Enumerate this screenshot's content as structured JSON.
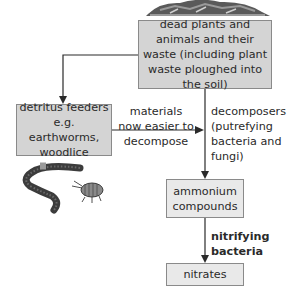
{
  "diagram": {
    "nodes": {
      "dead_matter": "dead plants and animals and their waste (including plant waste ploughed into the soil)",
      "detritus_feeders": "detritus feeders e.g. earthworms, woodlice",
      "ammonium": "ammonium compounds",
      "nitrates": "nitrates"
    },
    "edges": {
      "materials_label": "materials now easier to decompose",
      "decomposers_label": "decomposers (putrefying bacteria and fungi)",
      "nitrifying_label": "nitrifying bacteria"
    },
    "illustrations": {
      "top": "compost-heap-illustration",
      "bottom_left": "earthworm-and-woodlouse-illustration"
    },
    "colors": {
      "box_dark": "#d4d4d4",
      "box_light": "#e9e9e9",
      "line": "#2a2a2a"
    }
  }
}
